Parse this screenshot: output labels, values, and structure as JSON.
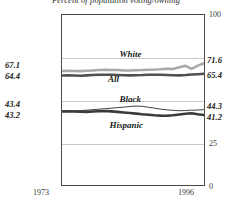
{
  "chart_data": {
    "type": "line",
    "title": "Percent of population voting/owning",
    "xlabel": "",
    "ylabel": "",
    "x": [
      1973,
      1974,
      1975,
      1976,
      1977,
      1978,
      1979,
      1980,
      1981,
      1982,
      1983,
      1984,
      1985,
      1986,
      1987,
      1988,
      1989,
      1990,
      1991,
      1992,
      1993,
      1994,
      1995,
      1996
    ],
    "xlim": [
      1973,
      1996
    ],
    "ylim": [
      0,
      100
    ],
    "yticks": [
      0,
      25,
      50,
      75,
      100
    ],
    "ytick_labels": [
      "0",
      "25",
      "50",
      "75",
      "100"
    ],
    "xtick_labels": [
      "1973",
      "1996"
    ],
    "grid": true,
    "legend_position": "inline-annotations",
    "series": [
      {
        "name": "White",
        "color": "#a8a8a8",
        "width": 2.6,
        "start_value": 67.1,
        "end_value": 71.6,
        "values": [
          67.1,
          67.2,
          67.1,
          67.0,
          67.2,
          67.4,
          67.6,
          67.8,
          67.7,
          67.6,
          67.4,
          67.3,
          67.5,
          67.6,
          67.8,
          67.9,
          68.1,
          68.4,
          68.2,
          68.5,
          69.4,
          70.3,
          69.1,
          71.6
        ],
        "values_detail": [
          67.1,
          67.2,
          67.1,
          67.0,
          67.2,
          67.4,
          67.6,
          67.8,
          67.7,
          67.6,
          67.4,
          67.3,
          67.5,
          67.6,
          67.8,
          67.9,
          68.1,
          68.4,
          68.2,
          69.2,
          70.1,
          68.3,
          70.2,
          71.6
        ]
      },
      {
        "name": "All",
        "color": "#505050",
        "width": 2.6,
        "start_value": 64.4,
        "end_value": 65.4,
        "values": [
          64.4,
          64.5,
          64.4,
          64.3,
          64.5,
          64.7,
          64.8,
          64.9,
          64.8,
          64.7,
          64.6,
          64.5,
          64.6,
          64.7,
          64.9,
          64.9,
          64.8,
          64.7,
          64.6,
          64.5,
          64.7,
          65.0,
          65.2,
          65.4
        ]
      },
      {
        "name": "Black",
        "color": "#3c3c3c",
        "width": 1.0,
        "start_value": 43.4,
        "end_value": 44.3,
        "values": [
          43.4,
          43.5,
          43.6,
          43.8,
          44.0,
          44.3,
          44.6,
          44.9,
          45.2,
          45.5,
          45.8,
          46.2,
          46.4,
          46.3,
          45.7,
          45.2,
          44.6,
          44.2,
          43.9,
          43.7,
          43.8,
          44.0,
          44.1,
          44.3
        ]
      },
      {
        "name": "Hispanic",
        "color": "#3a3a3a",
        "width": 2.6,
        "start_value": 43.2,
        "end_value": 41.2,
        "values": [
          43.2,
          43.3,
          43.2,
          43.1,
          43.0,
          43.2,
          43.4,
          43.5,
          43.3,
          43.0,
          42.7,
          42.4,
          42.0,
          41.6,
          41.3,
          41.0,
          40.8,
          40.7,
          41.0,
          41.5,
          41.9,
          42.2,
          41.6,
          41.2
        ]
      }
    ],
    "left_endpoint_labels": [
      {
        "series": "White",
        "value": "67.1"
      },
      {
        "series": "All",
        "value": "64.4"
      },
      {
        "series": "Black",
        "value": "43.4"
      },
      {
        "series": "Hispanic",
        "value": "43.2"
      }
    ],
    "right_endpoint_labels": [
      {
        "series": "White",
        "value": "71.6"
      },
      {
        "series": "All",
        "value": "65.4"
      },
      {
        "series": "Black",
        "value": "44.3"
      },
      {
        "series": "Hispanic",
        "value": "41.2"
      }
    ],
    "annotations": [
      {
        "text": "White",
        "x_frac": 0.4,
        "y_value": 76.5
      },
      {
        "text": "All",
        "x_frac": 0.32,
        "y_value": 62.0
      },
      {
        "text": "Black",
        "x_frac": 0.4,
        "y_value": 50.5
      },
      {
        "text": "Hispanic",
        "x_frac": 0.33,
        "y_value": 35.5
      }
    ]
  }
}
